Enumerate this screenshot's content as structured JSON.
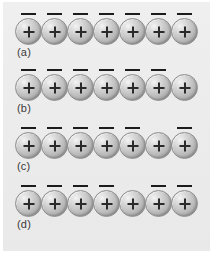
{
  "figure": {
    "background_color": "#ececec",
    "page_background": "#ffffff",
    "sphere_charge_symbol": "+",
    "sphere_count_per_row": 7,
    "dash_color": "#1c1c1c",
    "sphere_color": "#bcbcbc",
    "label_color": "#3a3a3a",
    "rows": [
      {
        "label": "(a)",
        "spheres": [
          "+",
          "+",
          "+",
          "+",
          "+",
          "+",
          "+"
        ],
        "dashes": [
          true,
          true,
          true,
          true,
          true,
          true,
          true
        ]
      },
      {
        "label": "(b)",
        "spheres": [
          "+",
          "+",
          "+",
          "+",
          "+",
          "+",
          "+"
        ],
        "dashes": [
          true,
          true,
          true,
          true,
          true,
          true,
          false
        ]
      },
      {
        "label": "(c)",
        "spheres": [
          "+",
          "+",
          "+",
          "+",
          "+",
          "+",
          "+"
        ],
        "dashes": [
          true,
          true,
          true,
          true,
          true,
          false,
          true
        ]
      },
      {
        "label": "(d)",
        "spheres": [
          "+",
          "+",
          "+",
          "+",
          "+",
          "+",
          "+"
        ],
        "dashes": [
          true,
          true,
          true,
          true,
          false,
          true,
          true
        ]
      }
    ]
  }
}
